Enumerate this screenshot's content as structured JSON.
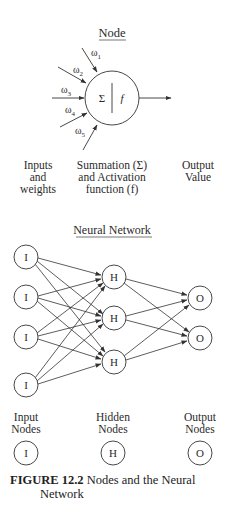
{
  "node_diagram": {
    "title": "Node",
    "weights": [
      "ω1",
      "ω2",
      "ω3",
      "ω4",
      "ω5"
    ],
    "weight_base": "ω",
    "weight_subscripts": [
      "1",
      "2",
      "3",
      "4",
      "5"
    ],
    "sum_symbol": "Σ",
    "func_symbol": "f",
    "labels": {
      "inputs": [
        "Inputs",
        "and",
        "weights"
      ],
      "summation": [
        "Summation (Σ)",
        "and Activation",
        "function (f)"
      ],
      "output": [
        "Output",
        "Value"
      ]
    }
  },
  "network_diagram": {
    "title": "Neural Network",
    "input_nodes": [
      "I",
      "I",
      "I",
      "I"
    ],
    "hidden_nodes": [
      "H",
      "H",
      "H"
    ],
    "output_nodes": [
      "O",
      "O"
    ],
    "legend": [
      {
        "line1": "Input",
        "line2": "Nodes",
        "symbol": "I"
      },
      {
        "line1": "Hidden",
        "line2": "Nodes",
        "symbol": "H"
      },
      {
        "line1": "Output",
        "line2": "Nodes",
        "symbol": "O"
      }
    ]
  },
  "caption": {
    "label": "FIGURE 12.2",
    "text": "Nodes and the Neural",
    "text_cont": "Network"
  }
}
